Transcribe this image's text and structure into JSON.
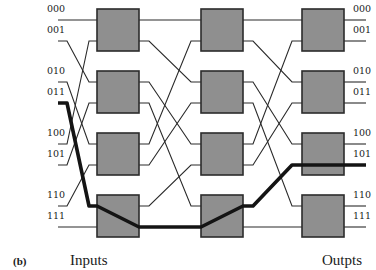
{
  "figure": {
    "panel_label": "(b)",
    "input_caption": "Inputs",
    "output_caption": "Outpts",
    "type": "multistage switching network (omega/shuffle-exchange)",
    "stages": 3,
    "switches_per_stage": 4
  },
  "inputs": [
    "000",
    "001",
    "010",
    "011",
    "100",
    "101",
    "110",
    "111"
  ],
  "outputs": [
    "000",
    "001",
    "010",
    "011",
    "100",
    "101",
    "110",
    "111"
  ],
  "highlighted_route": {
    "from_input": "011",
    "to_output": "101",
    "color": "#141414"
  },
  "colors": {
    "switch_fill": "#8f8f8f",
    "switch_border": "#2b2b2b",
    "wire": "#2a2a2a",
    "background": "#ffffff"
  }
}
